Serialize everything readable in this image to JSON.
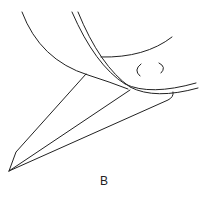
{
  "figure": {
    "panel_label": "B",
    "stroke_color": "#222222",
    "background": "#ffffff"
  }
}
